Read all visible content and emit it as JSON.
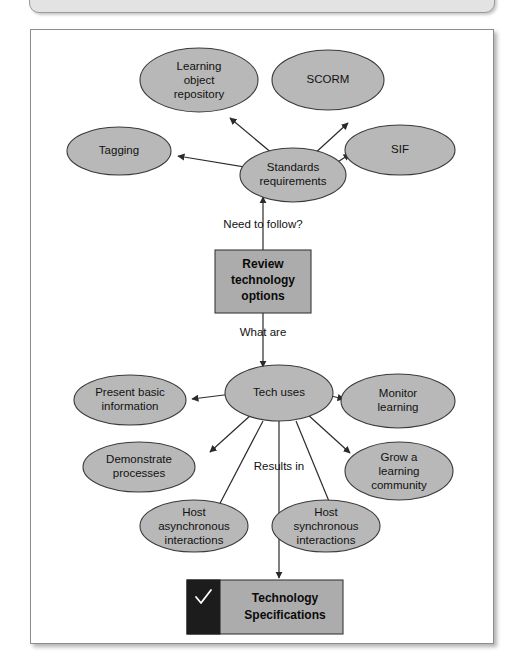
{
  "canvas": {
    "width": 526,
    "height": 670
  },
  "colors": {
    "node_fill": "#b8b8b8",
    "node_stroke": "#3a3a3a",
    "process_box_fill": "#acacac",
    "terminal_box_dark": "#1c1c1c",
    "frame_border": "#8d8d8d",
    "top_strip_fill": "#e3e3e3",
    "connector": "#2b2b2b",
    "text": "#111111"
  },
  "diagram": {
    "type": "concept-map-flowchart",
    "top_cluster": {
      "center_node": {
        "label_line1": "Standards",
        "label_line2": "requirements"
      },
      "satellites": [
        {
          "id": "learning-object-repository",
          "label_line1": "Learning",
          "label_line2": "object",
          "label_line3": "repository"
        },
        {
          "id": "scorm",
          "label_line1": "SCORM"
        },
        {
          "id": "tagging",
          "label_line1": "Tagging"
        },
        {
          "id": "sif",
          "label_line1": "SIF"
        }
      ]
    },
    "edge_labels": {
      "need_to_follow": "Need to follow?",
      "what_are": "What are",
      "results_in": "Results in"
    },
    "process_box": {
      "label_line1": "Review",
      "label_line2": "technology",
      "label_line3": "options"
    },
    "bottom_cluster": {
      "center_node": {
        "label_line1": "Tech uses"
      },
      "satellites": [
        {
          "id": "present-basic-information",
          "label_line1": "Present basic",
          "label_line2": "information"
        },
        {
          "id": "monitor-learning",
          "label_line1": "Monitor",
          "label_line2": "learning"
        },
        {
          "id": "demonstrate-processes",
          "label_line1": "Demonstrate",
          "label_line2": "processes"
        },
        {
          "id": "grow-a-learning-community",
          "label_line1": "Grow a",
          "label_line2": "learning",
          "label_line3": "community"
        },
        {
          "id": "host-asynchronous-interactions",
          "label_line1": "Host",
          "label_line2": "asynchronous",
          "label_line3": "interactions"
        },
        {
          "id": "host-synchronous-interactions",
          "label_line1": "Host",
          "label_line2": "synchronous",
          "label_line3": "interactions"
        }
      ]
    },
    "terminal_box": {
      "icon": "check-icon",
      "label_line1": "Technology",
      "label_line2": "Specifications"
    }
  }
}
